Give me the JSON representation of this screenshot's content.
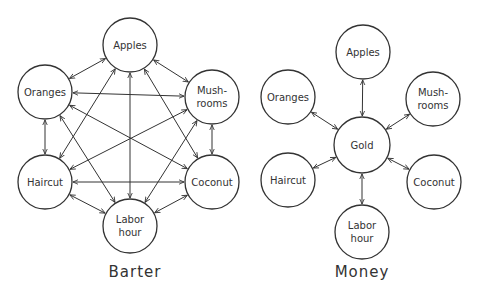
{
  "diagrams": [
    {
      "id": "barter",
      "caption": "Barter",
      "caption_pos": [
        135,
        277
      ],
      "topology": "complete-graph",
      "nodes": [
        {
          "id": "apples",
          "lines": [
            "Apples"
          ],
          "cx": 130,
          "cy": 45,
          "r": 27
        },
        {
          "id": "oranges",
          "lines": [
            "Oranges"
          ],
          "cx": 45,
          "cy": 92,
          "r": 27
        },
        {
          "id": "mushrooms",
          "lines": [
            "Mush-",
            "rooms"
          ],
          "cx": 212,
          "cy": 97,
          "r": 27
        },
        {
          "id": "haircut",
          "lines": [
            "Haircut"
          ],
          "cx": 45,
          "cy": 182,
          "r": 27
        },
        {
          "id": "coconut",
          "lines": [
            "Coconut"
          ],
          "cx": 212,
          "cy": 182,
          "r": 27
        },
        {
          "id": "labor-hour",
          "lines": [
            "Labor",
            "hour"
          ],
          "cx": 130,
          "cy": 226,
          "r": 27
        }
      ]
    },
    {
      "id": "money",
      "caption": "Money",
      "caption_pos": [
        362,
        277
      ],
      "topology": "hub",
      "hub": "gold",
      "nodes": [
        {
          "id": "apples",
          "lines": [
            "Apples"
          ],
          "cx": 363,
          "cy": 52,
          "r": 27
        },
        {
          "id": "oranges",
          "lines": [
            "Oranges"
          ],
          "cx": 288,
          "cy": 97,
          "r": 27
        },
        {
          "id": "mushrooms",
          "lines": [
            "Mush-",
            "rooms"
          ],
          "cx": 433,
          "cy": 99,
          "r": 27
        },
        {
          "id": "gold",
          "lines": [
            "Gold"
          ],
          "cx": 362,
          "cy": 145,
          "r": 28
        },
        {
          "id": "haircut",
          "lines": [
            "Haircut"
          ],
          "cx": 288,
          "cy": 180,
          "r": 27
        },
        {
          "id": "coconut",
          "lines": [
            "Coconut"
          ],
          "cx": 434,
          "cy": 182,
          "r": 27
        },
        {
          "id": "labor-hour",
          "lines": [
            "Labor",
            "hour"
          ],
          "cx": 362,
          "cy": 232,
          "r": 27
        }
      ]
    }
  ],
  "colors": {
    "stroke": "#333333",
    "text": "#333333",
    "background": "#ffffff"
  }
}
